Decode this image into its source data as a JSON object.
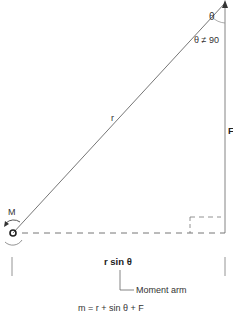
{
  "diagram": {
    "labels": {
      "theta": "θ",
      "theta_note": "θ ≠ 90",
      "r": "r",
      "force": "F",
      "moment": "M",
      "moment_arm_length": "r sin θ",
      "moment_arm": "Moment arm",
      "formula": "m = r + sin θ + F"
    },
    "colors": {
      "line": "#555555",
      "text": "#333333",
      "background": "#ffffff"
    }
  }
}
